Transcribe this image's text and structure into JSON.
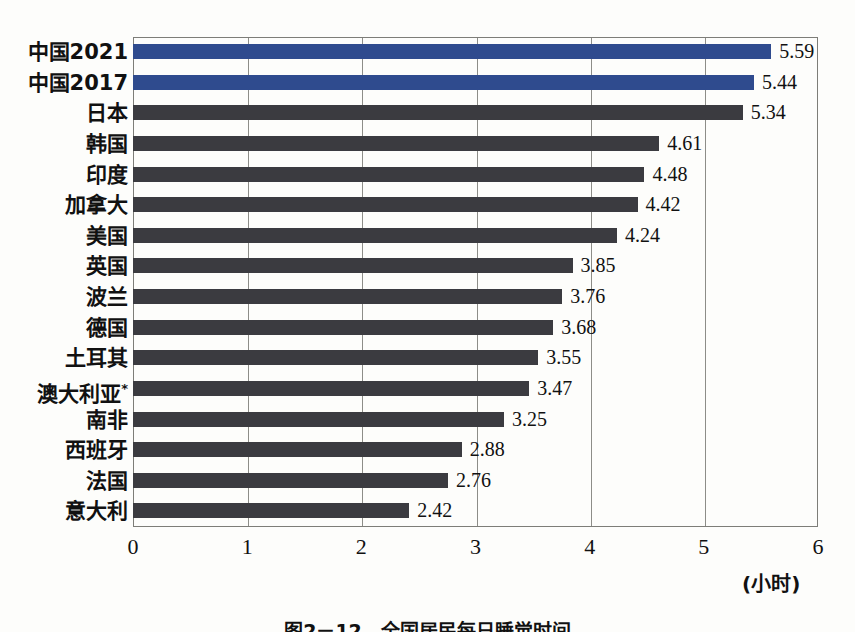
{
  "chart_data": {
    "type": "bar",
    "orientation": "horizontal",
    "title": "",
    "xlabel": "(小时)",
    "ylabel": "",
    "xlim": [
      0,
      6
    ],
    "xticks": [
      "0",
      "1",
      "2",
      "3",
      "4",
      "5",
      "6"
    ],
    "grid": true,
    "legend": "none",
    "categories": [
      "中国2021",
      "中国2017",
      "日本",
      "韩国",
      "印度",
      "加拿大",
      "美国",
      "英国",
      "波兰",
      "德国",
      "土耳其",
      "澳大利亚*",
      "南非",
      "西班牙",
      "法国",
      "意大利"
    ],
    "values": [
      5.59,
      5.44,
      5.34,
      4.61,
      4.48,
      4.42,
      4.24,
      3.85,
      3.76,
      3.68,
      3.55,
      3.47,
      3.25,
      2.88,
      2.76,
      2.42
    ],
    "value_labels": [
      "5.59",
      "5.44",
      "5.34",
      "4.61",
      "4.48",
      "4.42",
      "4.24",
      "3.85",
      "3.76",
      "3.68",
      "3.55",
      "3.47",
      "3.25",
      "2.88",
      "2.76",
      "2.42"
    ],
    "highlighted": [
      true,
      true,
      false,
      false,
      false,
      false,
      false,
      false,
      false,
      false,
      false,
      false,
      false,
      false,
      false,
      false
    ],
    "annotations": [
      "澳大利亚带星号表示数据另有说明"
    ]
  },
  "colors": {
    "highlight_bar": "#2f4b8e",
    "default_bar": "#3b3b40",
    "grid": "#8d8d88",
    "frame": "#7d7d78",
    "background": "#fdfdfb",
    "text": "#111111"
  },
  "caption": {
    "text": "图2－12　全国居民每日睡觉时间",
    "clipped": true
  }
}
